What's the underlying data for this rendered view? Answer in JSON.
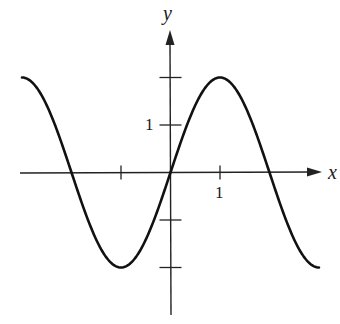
{
  "chart_data": {
    "type": "line",
    "title": "",
    "xlabel": "x",
    "ylabel": "y",
    "function": "y = 2 sin(pi x / 2)",
    "xlim": [
      -3,
      3
    ],
    "ylim": [
      -2,
      2
    ],
    "grid": false,
    "legend": null,
    "x_ticks": [
      -1,
      1
    ],
    "x_tick_labels": {
      "1": "1"
    },
    "y_ticks": [
      -2,
      -1,
      1,
      2
    ],
    "y_tick_labels": {
      "1": "1"
    },
    "series": [
      {
        "name": "curve",
        "x": [
          -3,
          -2.5,
          -2,
          -1.5,
          -1,
          -0.5,
          0,
          0.5,
          1,
          1.5,
          2,
          2.5,
          3
        ],
        "y": [
          2,
          1.41,
          0,
          -1.41,
          -2,
          -1.41,
          0,
          1.41,
          2,
          1.41,
          0,
          -1.41,
          -2
        ]
      }
    ],
    "annotations": []
  },
  "labels": {
    "x_axis": "x",
    "y_axis": "y",
    "x_tick_one": "1",
    "y_tick_one": "1"
  },
  "colors": {
    "curve": "#111111",
    "axis": "#222222",
    "background": "#ffffff"
  }
}
